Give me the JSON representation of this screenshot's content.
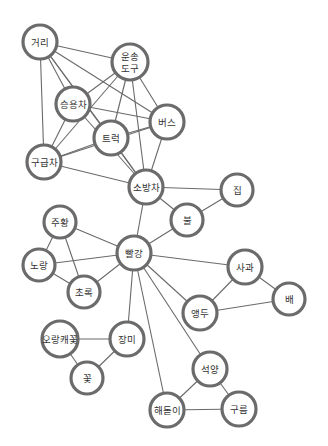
{
  "diagram": {
    "title": "",
    "colors": {
      "edge": "#6a6a6a",
      "node_stroke": "#6b6b6b",
      "node_fill": "#ffffff",
      "label": "#333333",
      "background": "#ffffff"
    },
    "nodes": [
      {
        "id": "street",
        "label": "거리",
        "x": 40,
        "y": 42,
        "r": 17
      },
      {
        "id": "transport",
        "label": "운송\n도구",
        "lines": [
          "운송",
          "도구"
        ],
        "x": 130,
        "y": 62,
        "r": 18
      },
      {
        "id": "car",
        "label": "승용차",
        "x": 73,
        "y": 104,
        "r": 17
      },
      {
        "id": "truck",
        "label": "트럭",
        "x": 111,
        "y": 138,
        "r": 17
      },
      {
        "id": "bus",
        "label": "버스",
        "x": 167,
        "y": 122,
        "r": 17
      },
      {
        "id": "ambulance",
        "label": "구급차",
        "x": 44,
        "y": 162,
        "r": 17
      },
      {
        "id": "firetruck",
        "label": "소방차",
        "x": 146,
        "y": 187,
        "r": 17
      },
      {
        "id": "house",
        "label": "집",
        "x": 237,
        "y": 190,
        "r": 16
      },
      {
        "id": "fire",
        "label": "불",
        "x": 187,
        "y": 220,
        "r": 16
      },
      {
        "id": "orange",
        "label": "주황",
        "x": 60,
        "y": 222,
        "r": 16
      },
      {
        "id": "red",
        "label": "빨강",
        "x": 134,
        "y": 253,
        "r": 17
      },
      {
        "id": "yellow",
        "label": "노랑",
        "x": 39,
        "y": 265,
        "r": 16
      },
      {
        "id": "green",
        "label": "초록",
        "x": 84,
        "y": 292,
        "r": 16
      },
      {
        "id": "apple",
        "label": "사과",
        "x": 245,
        "y": 267,
        "r": 17
      },
      {
        "id": "pear",
        "label": "배",
        "x": 289,
        "y": 299,
        "r": 16
      },
      {
        "id": "cherry",
        "label": "앵두",
        "x": 200,
        "y": 313,
        "r": 17
      },
      {
        "id": "rose",
        "label": "장미",
        "x": 127,
        "y": 339,
        "r": 17
      },
      {
        "id": "violet",
        "label": "오랑캐꽃",
        "x": 60,
        "y": 339,
        "r": 18
      },
      {
        "id": "flower",
        "label": "꽃",
        "x": 87,
        "y": 378,
        "r": 16
      },
      {
        "id": "sunset",
        "label": "석양",
        "x": 210,
        "y": 369,
        "r": 17
      },
      {
        "id": "sunrise",
        "label": "해돋이",
        "x": 167,
        "y": 410,
        "r": 17
      },
      {
        "id": "cloud",
        "label": "구름",
        "x": 239,
        "y": 409,
        "r": 17
      }
    ],
    "edges": [
      [
        "street",
        "transport"
      ],
      [
        "street",
        "car"
      ],
      [
        "street",
        "truck"
      ],
      [
        "street",
        "bus"
      ],
      [
        "street",
        "ambulance"
      ],
      [
        "street",
        "firetruck"
      ],
      [
        "transport",
        "car"
      ],
      [
        "transport",
        "truck"
      ],
      [
        "transport",
        "bus"
      ],
      [
        "transport",
        "ambulance"
      ],
      [
        "transport",
        "firetruck"
      ],
      [
        "car",
        "bus"
      ],
      [
        "car",
        "ambulance"
      ],
      [
        "car",
        "firetruck"
      ],
      [
        "truck",
        "bus"
      ],
      [
        "truck",
        "ambulance"
      ],
      [
        "truck",
        "firetruck"
      ],
      [
        "bus",
        "ambulance"
      ],
      [
        "bus",
        "firetruck"
      ],
      [
        "ambulance",
        "firetruck"
      ],
      [
        "firetruck",
        "house"
      ],
      [
        "firetruck",
        "fire"
      ],
      [
        "firetruck",
        "red"
      ],
      [
        "house",
        "fire"
      ],
      [
        "fire",
        "red"
      ],
      [
        "orange",
        "red"
      ],
      [
        "orange",
        "yellow"
      ],
      [
        "orange",
        "green"
      ],
      [
        "yellow",
        "red"
      ],
      [
        "yellow",
        "green"
      ],
      [
        "green",
        "red"
      ],
      [
        "red",
        "apple"
      ],
      [
        "red",
        "cherry"
      ],
      [
        "red",
        "rose"
      ],
      [
        "red",
        "sunset"
      ],
      [
        "red",
        "sunrise"
      ],
      [
        "apple",
        "pear"
      ],
      [
        "apple",
        "cherry"
      ],
      [
        "cherry",
        "pear"
      ],
      [
        "rose",
        "violet"
      ],
      [
        "rose",
        "flower"
      ],
      [
        "violet",
        "flower"
      ],
      [
        "sunset",
        "sunrise"
      ],
      [
        "sunset",
        "cloud"
      ],
      [
        "sunrise",
        "cloud"
      ]
    ]
  }
}
